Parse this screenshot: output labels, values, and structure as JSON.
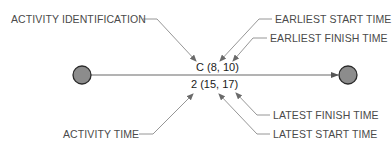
{
  "diagram": {
    "type": "activity-on-arrow network notation",
    "activity_label": "C (8, 10)",
    "activity_time_label": "2 (15, 17)",
    "annotations": {
      "activity_identification": "ACTIVITY IDENTIFICATION",
      "earliest_start_time": "EARLIEST START TIME",
      "earliest_finish_time": "EARLIEST FINISH TIME",
      "activity_time": "ACTIVITY TIME",
      "latest_finish_time": "LATEST FINISH TIME",
      "latest_start_time": "LATEST START TIME"
    },
    "colors": {
      "node_fill": "#8c8c8c",
      "node_stroke": "#2a2a2a",
      "edge": "#9a9a9a",
      "leader": "#8a8a8a",
      "text": "#4a4a4a"
    }
  }
}
